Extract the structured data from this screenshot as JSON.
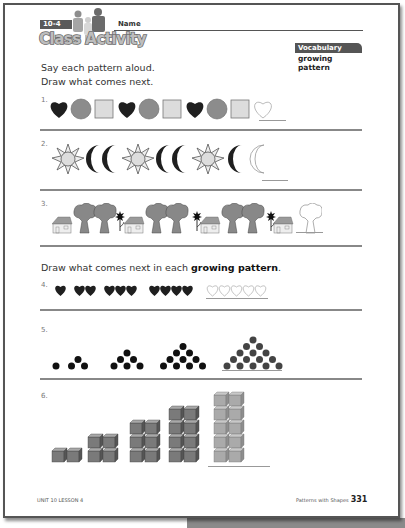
{
  "header": {
    "lesson_badge": "10-4",
    "title": "Class Activity",
    "name_label": "Name"
  },
  "vocabulary": {
    "heading": "Vocabulary",
    "term": "growing pattern"
  },
  "section1": {
    "instruction_line1": "Say each pattern aloud.",
    "instruction_line2": "Draw what comes next."
  },
  "problems": [
    {
      "number": "1.",
      "pattern": [
        "heart",
        "circle",
        "square",
        "heart",
        "circle",
        "square",
        "heart",
        "circle",
        "square"
      ],
      "answer": "heart"
    },
    {
      "number": "2.",
      "pattern": [
        "sun",
        "moon",
        "moon",
        "sun",
        "moon",
        "moon",
        "sun",
        "moon"
      ],
      "answer": "moon"
    },
    {
      "number": "3.",
      "pattern": [
        "house",
        "tree",
        "tree",
        "flower",
        "house",
        "tree",
        "tree",
        "flower",
        "house",
        "tree",
        "tree",
        "flower",
        "house"
      ],
      "answer": "tree"
    },
    {
      "number": "4.",
      "pattern_counts": [
        1,
        2,
        3,
        4
      ],
      "shape": "heart",
      "answer_count": 5
    },
    {
      "number": "5.",
      "pattern_counts": [
        1,
        3,
        6,
        10
      ],
      "shape": "dot-triangle",
      "answer_count": 15
    },
    {
      "number": "6.",
      "pattern_counts": [
        2,
        4,
        6,
        8
      ],
      "shape": "cube-stack",
      "answer_count": 10
    }
  ],
  "section2": {
    "instruction_prefix": "Draw what comes next in each ",
    "instruction_term": "growing pattern",
    "instruction_suffix": "."
  },
  "footer": {
    "left": "UNIT 10 LESSON 4",
    "right_text": "Patterns with Shapes",
    "page_number": "331"
  },
  "colors": {
    "dark_shape": "#1f1f1f",
    "mid_gray": "#8c8c8c",
    "light_gray": "#d6d6d6",
    "answer_gray": "#b0b0b0",
    "cube_gray": "#7a7a7a"
  }
}
